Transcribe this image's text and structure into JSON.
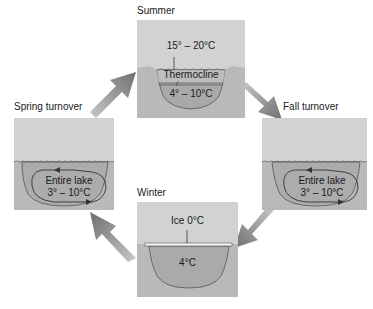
{
  "panels": {
    "summer": {
      "label": "Summer",
      "surface_temp": "15° – 20°C",
      "layer": "Thermocline",
      "bottom_temp": "4° – 10°C"
    },
    "fall": {
      "label": "Fall turnover",
      "line1": "Entire lake",
      "line2": "3° – 10°C"
    },
    "winter": {
      "label": "Winter",
      "ice": "Ice 0°C",
      "bottom_temp": "4°C"
    },
    "spring": {
      "label": "Spring turnover",
      "line1": "Entire lake",
      "line2": "3° – 10°C"
    }
  },
  "colors": {
    "sky": "#d4d4d4",
    "ground": "#b8b8b8",
    "water": "#a8a8a8",
    "water_light": "#bdbdbd",
    "arrow": "#8a8a8a",
    "outline": "#444444"
  },
  "cycle_order": [
    "Summer",
    "Fall turnover",
    "Winter",
    "Spring turnover"
  ]
}
